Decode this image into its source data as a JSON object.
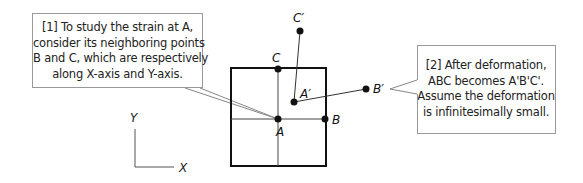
{
  "callouts": [
    {
      "id": "1",
      "lines": [
        "[1] To study the strain at A,",
        "consider its neighboring points",
        "B and C, which are respectively",
        "along X-axis and Y-axis."
      ]
    },
    {
      "id": "2",
      "lines": [
        "[2] After deformation,",
        "ABC becomes A'B'C'.",
        "Assume the deformation",
        "is infinitesimally small."
      ]
    }
  ],
  "points": {
    "A": {
      "label": "A",
      "x": 278,
      "y": 119
    },
    "B": {
      "label": "B",
      "x": 325,
      "y": 119
    },
    "C": {
      "label": "C",
      "x": 278,
      "y": 69
    },
    "A_prime": {
      "label": "A′",
      "x": 294,
      "y": 102
    },
    "B_prime": {
      "label": "B′",
      "x": 366,
      "y": 89
    },
    "C_prime": {
      "label": "C′",
      "x": 300,
      "y": 31
    }
  },
  "axes": {
    "x_label": "X",
    "y_label": "Y"
  }
}
